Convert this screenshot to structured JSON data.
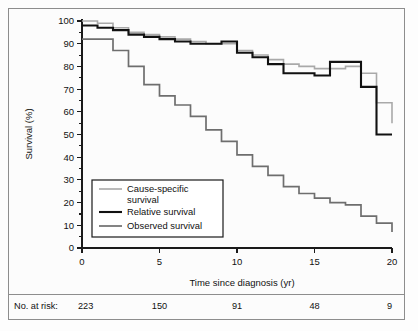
{
  "chart_data": {
    "type": "line",
    "title": "",
    "subtitle": "",
    "xlabel": "Time since diagnosis (yr)",
    "ylabel": "Survival (%)",
    "xlim": [
      0,
      20
    ],
    "ylim": [
      0,
      100
    ],
    "xticks": [
      0,
      5,
      10,
      15,
      20
    ],
    "yticks": [
      0,
      10,
      20,
      30,
      40,
      50,
      60,
      70,
      80,
      90,
      100
    ],
    "xtick_labels": [
      "0",
      "5",
      "10",
      "15",
      "20"
    ],
    "ytick_labels": [
      "0",
      "10",
      "20",
      "30",
      "40",
      "50",
      "60",
      "70",
      "80",
      "90",
      "100"
    ],
    "ytick_minor": [
      5,
      15,
      25,
      35,
      45,
      55,
      65,
      75,
      85,
      95
    ],
    "grid": false,
    "legend_position": "lower-left",
    "step_style": "post",
    "x": [
      0,
      1,
      2,
      3,
      4,
      5,
      6,
      7,
      8,
      9,
      10,
      11,
      12,
      13,
      14,
      15,
      16,
      17,
      18,
      19,
      20
    ],
    "series": [
      {
        "name": "Cause-specific survival",
        "color": "#a9a9a9",
        "line_width": 1.6,
        "values": [
          100,
          99,
          97,
          95,
          94,
          93,
          92,
          91,
          90,
          90,
          87,
          85,
          83,
          81,
          80,
          79,
          79,
          80,
          77,
          64,
          55
        ]
      },
      {
        "name": "Relative survival",
        "color": "#111111",
        "line_width": 2.1,
        "values": [
          98,
          97,
          96,
          94,
          93,
          92,
          91,
          90,
          90,
          91,
          86,
          84,
          81,
          77,
          77,
          76,
          82,
          82,
          71,
          50,
          50
        ]
      },
      {
        "name": "Observed survival",
        "color": "#6e6e6e",
        "line_width": 1.7,
        "values": [
          92,
          92,
          87,
          80,
          72,
          67,
          63,
          58,
          52,
          47,
          41,
          36,
          32,
          27,
          24,
          22,
          20,
          19,
          14,
          11,
          7
        ]
      }
    ],
    "legend": [
      {
        "label_line1": "Cause-specific",
        "label_line2": "survival",
        "color": "#a9a9a9",
        "line_width": 1.6
      },
      {
        "label_line1": "Relative survival",
        "label_line2": "",
        "color": "#111111",
        "line_width": 2.1
      },
      {
        "label_line1": "Observed survival",
        "label_line2": "",
        "color": "#6e6e6e",
        "line_width": 1.7
      }
    ],
    "risk_table": {
      "label": "No. at risk:",
      "x_positions": [
        0,
        5,
        10,
        15,
        20
      ],
      "counts": [
        "223",
        "150",
        "91",
        "48",
        "9"
      ]
    }
  }
}
